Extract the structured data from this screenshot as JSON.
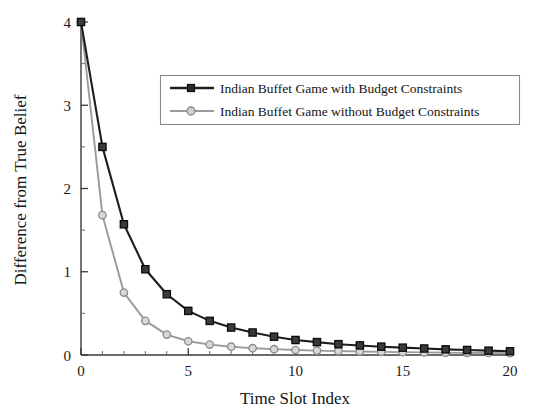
{
  "chart_data": {
    "type": "line",
    "title": "",
    "xlabel": "Time Slot Index",
    "ylabel": "Difference from True Belief",
    "xlim": [
      0,
      20
    ],
    "ylim": [
      0,
      4
    ],
    "x_ticks": [
      0,
      5,
      10,
      15,
      20
    ],
    "y_ticks": [
      0,
      1,
      2,
      3,
      4
    ],
    "x_tick_labels": [
      "0",
      "5",
      "10",
      "15",
      "20"
    ],
    "y_tick_labels": [
      "0",
      "1",
      "2",
      "3",
      "4"
    ],
    "x_minor_step": 1,
    "y_minor_step": 0.5,
    "grid": false,
    "legend_position": "upper center",
    "x": [
      0,
      1,
      2,
      3,
      4,
      5,
      6,
      7,
      8,
      9,
      10,
      11,
      12,
      13,
      14,
      15,
      16,
      17,
      18,
      19,
      20
    ],
    "series": [
      {
        "name": "Indian Buffet Game with Budget Constraints",
        "color": "#1d1d1d",
        "marker": "square",
        "values": [
          4.0,
          2.5,
          1.57,
          1.03,
          0.73,
          0.53,
          0.41,
          0.33,
          0.27,
          0.22,
          0.18,
          0.155,
          0.13,
          0.115,
          0.1,
          0.088,
          0.078,
          0.068,
          0.06,
          0.052,
          0.045
        ]
      },
      {
        "name": "Indian Buffet Game without Budget Constraints",
        "color": "#9a9a9a",
        "marker": "circle",
        "values": [
          4.0,
          1.68,
          0.75,
          0.41,
          0.245,
          0.165,
          0.125,
          0.1,
          0.082,
          0.07,
          0.06,
          0.053,
          0.047,
          0.042,
          0.038,
          0.034,
          0.031,
          0.028,
          0.026,
          0.024,
          0.022
        ]
      }
    ]
  },
  "legend": {
    "entries": [
      {
        "label": "Indian Buffet Game with Budget Constraints"
      },
      {
        "label": "Indian Buffet Game without Budget Constraints"
      }
    ]
  },
  "axes": {
    "x_title": "Time Slot Index",
    "y_title": "Difference from True Belief"
  },
  "colors": {
    "series_with_budget": "#1d1d1d",
    "series_without_budget": "#9a9a9a",
    "axis": "#3a3a3a",
    "background": "#ffffff"
  }
}
